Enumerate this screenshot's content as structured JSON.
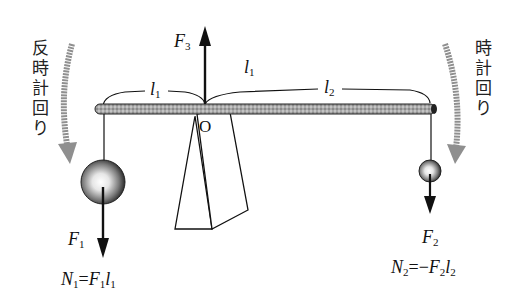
{
  "figure": {
    "labels": {
      "counterclockwise": [
        "反",
        "時",
        "計",
        "回",
        "り"
      ],
      "clockwise": [
        "時",
        "計",
        "回",
        "り"
      ],
      "pivot": "O",
      "force_up": {
        "base": "F",
        "sub": "3"
      },
      "force_left": {
        "base": "F",
        "sub": "1"
      },
      "force_right": {
        "base": "F",
        "sub": "2"
      },
      "arm_left": {
        "base": "l",
        "sub": "1"
      },
      "arm_right": {
        "base": "l",
        "sub": "2"
      },
      "arm_top": {
        "base": "l",
        "sub": "1"
      },
      "moment_left": {
        "lhs_base": "N",
        "lhs_sub": "1",
        "eq": "=",
        "rhs": [
          {
            "base": "F",
            "sub": "1"
          },
          {
            "base": "l",
            "sub": "1"
          }
        ]
      },
      "moment_right": {
        "lhs_base": "N",
        "lhs_sub": "2",
        "eq": "=",
        "sign": "−",
        "rhs": [
          {
            "base": "F",
            "sub": "2"
          },
          {
            "base": "l",
            "sub": "2"
          }
        ]
      }
    },
    "colors": {
      "ink": "#111111",
      "bar_fill": "#9a9a9a",
      "rotation_arrow": "#8f8f8f",
      "ball_dark": "#2a2a2a",
      "ball_light": "#ffffff"
    }
  }
}
